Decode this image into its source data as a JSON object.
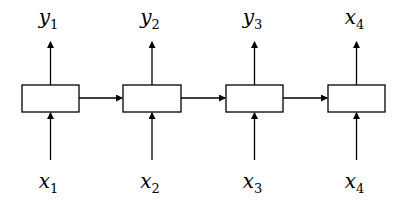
{
  "diagram": {
    "type": "recurrent sequence diagram",
    "stroke_color": "#000000",
    "background": "#ffffff",
    "cells": [
      {
        "id": "cell-1",
        "x": 22,
        "y": 85,
        "w": 57,
        "h": 27,
        "input": {
          "base": "x",
          "sub": "1"
        },
        "output": {
          "base": "y",
          "sub": "1"
        }
      },
      {
        "id": "cell-2",
        "x": 123,
        "y": 85,
        "w": 58,
        "h": 27,
        "input": {
          "base": "x",
          "sub": "2"
        },
        "output": {
          "base": "y",
          "sub": "2"
        }
      },
      {
        "id": "cell-3",
        "x": 226,
        "y": 85,
        "w": 57,
        "h": 27,
        "input": {
          "base": "x",
          "sub": "3"
        },
        "output": {
          "base": "y",
          "sub": "3"
        }
      },
      {
        "id": "cell-4",
        "x": 328,
        "y": 85,
        "w": 57,
        "h": 27,
        "input": {
          "base": "x",
          "sub": "4"
        },
        "output": {
          "base": "x",
          "sub": "4"
        }
      }
    ]
  }
}
